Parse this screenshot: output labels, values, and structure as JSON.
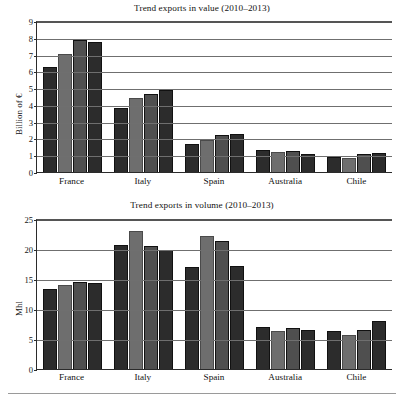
{
  "figure": {
    "background": "#ffffff",
    "bar_colors": [
      "#2c2c2c",
      "#6e6e6e",
      "#4f4f4f",
      "#2c2c2c"
    ]
  },
  "chart_data": [
    {
      "type": "bar",
      "id": "trend-exports-value",
      "title": "Trend exports in value (2010–2013)",
      "xlabel": "",
      "ylabel": "Billion of €",
      "categories": [
        "France",
        "Italy",
        "Spain",
        "Australia",
        "Chile"
      ],
      "yticks": [
        0,
        1,
        2,
        3,
        4,
        5,
        6,
        7,
        8,
        9
      ],
      "ylim": [
        0,
        9
      ],
      "grid": true,
      "legend": "none",
      "series": [
        {
          "name": "2010",
          "values": [
            6.3,
            3.9,
            1.7,
            1.35,
            0.95
          ]
        },
        {
          "name": "2011",
          "values": [
            7.1,
            4.45,
            1.95,
            1.25,
            0.92
          ]
        },
        {
          "name": "2012",
          "values": [
            7.9,
            4.7,
            2.25,
            1.3,
            1.12
          ]
        },
        {
          "name": "2013",
          "values": [
            7.8,
            4.95,
            2.35,
            1.15,
            1.2
          ]
        }
      ]
    },
    {
      "type": "bar",
      "id": "trend-exports-volume",
      "title": "Trend exports in volume (2010–2013)",
      "xlabel": "",
      "ylabel": "Mhl",
      "categories": [
        "France",
        "Italy",
        "Spain",
        "Australia",
        "Chile"
      ],
      "yticks": [
        0,
        5,
        10,
        15,
        20,
        25
      ],
      "ylim": [
        0,
        25
      ],
      "grid": true,
      "legend": "none",
      "series": [
        {
          "name": "2010",
          "values": [
            13.5,
            20.9,
            17.1,
            7.1,
            6.5
          ]
        },
        {
          "name": "2011",
          "values": [
            14.2,
            23.1,
            22.4,
            6.5,
            5.9
          ]
        },
        {
          "name": "2012",
          "values": [
            14.7,
            20.7,
            21.5,
            7.0,
            6.6
          ]
        },
        {
          "name": "2013",
          "values": [
            14.5,
            20.0,
            17.3,
            6.7,
            8.2
          ]
        }
      ]
    }
  ]
}
